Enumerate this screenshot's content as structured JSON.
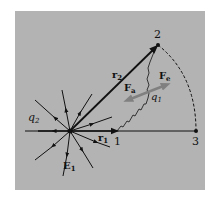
{
  "figure": {
    "background_color": "#b3b3b3",
    "line_color": "#111111",
    "force_arrow_color": "#808080",
    "labels": {
      "q2": "q",
      "q2_sub": "2",
      "q1": "q",
      "q1_sub": "1",
      "E1": "E",
      "E1_sub": "1",
      "r1": "r",
      "r1_sub": "1",
      "r2": "r",
      "r2_sub": "2",
      "Fe": "F",
      "Fe_sub": "e",
      "Fa": "F",
      "Fa_sub": "a",
      "point1": "1",
      "point2": "2",
      "point3": "3"
    }
  }
}
